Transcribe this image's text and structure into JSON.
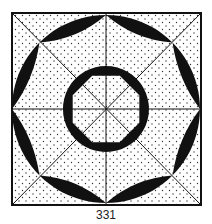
{
  "figure": {
    "caption": "331",
    "colors": {
      "ink": "#111111",
      "paper": "#ffffff",
      "stipple": "#333333"
    },
    "square": {
      "x": 12,
      "y": 13,
      "size": 189
    },
    "center": {
      "x": 106,
      "y": 109
    },
    "outer_circle_radius": 94,
    "inner_circle_radius": 43,
    "inner_octagon_radius": 36,
    "outer_star_vertex_radius": 94,
    "outer_star_inner_radius": 75
  }
}
